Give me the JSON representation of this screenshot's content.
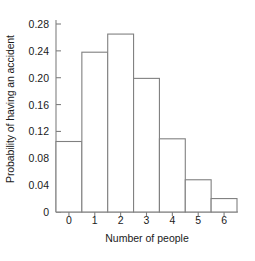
{
  "chart_data": {
    "type": "bar",
    "title": "",
    "subtitle": "",
    "xlabel": "Number of people",
    "ylabel": "Probability of having an accident",
    "categories": [
      "0",
      "1",
      "2",
      "3",
      "4",
      "5",
      "6"
    ],
    "values": [
      0.105,
      0.238,
      0.265,
      0.199,
      0.109,
      0.048,
      0.02
    ],
    "series": [
      {
        "name": "Probability of having an accident",
        "values": [
          0.105,
          0.238,
          0.265,
          0.199,
          0.109,
          0.048,
          0.02
        ]
      }
    ],
    "xlim": [
      -0.5,
      6.5
    ],
    "ylim": [
      0,
      0.28
    ],
    "yticks": [
      0,
      0.04,
      0.08,
      0.12,
      0.16,
      0.2,
      0.24,
      0.28
    ],
    "ytick_labels": [
      "0",
      "0.04",
      "0.08",
      "0.12",
      "0.16",
      "0.20",
      "0.24",
      "0.28"
    ],
    "xticks": [
      0,
      1,
      2,
      3,
      4,
      5,
      6
    ],
    "xtick_labels": [
      "0",
      "1",
      "2",
      "3",
      "4",
      "5",
      "6"
    ],
    "grid": false,
    "legend": false,
    "legend_position": "none",
    "bar_fill": "#ffffff",
    "bar_edge_color": "#808080",
    "axis_color": "#808080",
    "background": "#ffffff",
    "bar_width": 1.0,
    "annotations": []
  },
  "axes": {
    "y_title": "Probability of having an accident",
    "x_title": "Number of people"
  }
}
